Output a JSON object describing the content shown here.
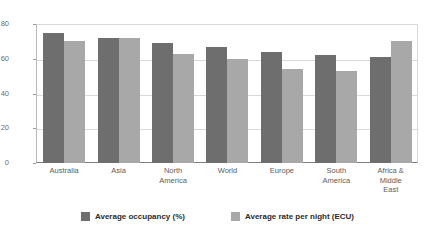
{
  "chart_data": {
    "type": "bar",
    "title": "",
    "subtitle": "",
    "xlabel": "",
    "ylabel": "",
    "ylim": [
      0,
      80
    ],
    "yticks": [
      0,
      20,
      40,
      60,
      80
    ],
    "grid": true,
    "legend_position": "bottom",
    "categories": [
      "Australia",
      "Asia",
      "North America",
      "World",
      "Europe",
      "South America",
      "Africa & Middle East"
    ],
    "series": [
      {
        "name": "Average occupancy (%)",
        "color": "#6e6e6e",
        "values": [
          75,
          72,
          69,
          67,
          64,
          62,
          61
        ]
      },
      {
        "name": "Average rate per night (ECU)",
        "color": "#a8a8a8",
        "values": [
          70,
          72,
          63,
          60,
          54,
          53,
          70
        ]
      }
    ]
  },
  "axis": {
    "y_tick_labels": [
      "80",
      "60",
      "40",
      "20",
      "0"
    ]
  },
  "x_axis_labels": [
    "Australia",
    "Asia",
    "North\nAmerica",
    "World",
    "Europe",
    "South\nAmerica",
    "Africa &\nMiddle\nEast"
  ],
  "legend": {
    "items": [
      {
        "label": "Average occupancy (%)",
        "color": "#6e6e6e"
      },
      {
        "label": "Average rate per night (ECU)",
        "color": "#a8a8a8"
      }
    ]
  }
}
